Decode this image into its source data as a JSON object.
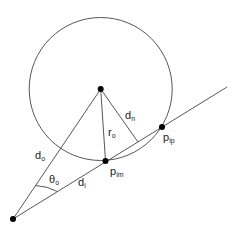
{
  "diagram": {
    "colors": {
      "stroke": "#333333",
      "point": "#000000",
      "background": "#ffffff"
    },
    "circle": {
      "cx": 100.7,
      "cy": 89,
      "r": 71.5
    },
    "points": {
      "center": {
        "x": 100.7,
        "y": 89
      },
      "origin": {
        "x": 13,
        "y": 219
      },
      "p_im": {
        "x": 105.5,
        "y": 161
      },
      "p_ip": {
        "x": 162,
        "y": 127
      }
    },
    "labels": {
      "d_o": {
        "base": "d",
        "sub": "o"
      },
      "theta_o": {
        "base": "θ",
        "sub": "o"
      },
      "d_i": {
        "base": "d",
        "sub": "i"
      },
      "r_o": {
        "base": "r",
        "sub": "o"
      },
      "d_n": {
        "base": "d",
        "sub": "n"
      },
      "p_im": {
        "base": "p",
        "sub": "im"
      },
      "p_ip": {
        "base": "p",
        "sub": "ip"
      }
    }
  }
}
